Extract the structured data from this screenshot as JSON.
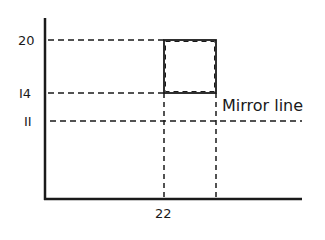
{
  "diagram": {
    "y_labels": [
      {
        "text": "20",
        "value": 20
      },
      {
        "text": "I4",
        "value": 14
      },
      {
        "text": "II",
        "value": 11
      }
    ],
    "x_labels": [
      {
        "text": "22",
        "value": 22
      }
    ],
    "mirror_label": "Mirror line",
    "square": {
      "x_left": 22,
      "y_bottom": 14,
      "y_top": 20
    },
    "colors": {
      "line": "#1a1a1a",
      "background": "#ffffff"
    }
  }
}
